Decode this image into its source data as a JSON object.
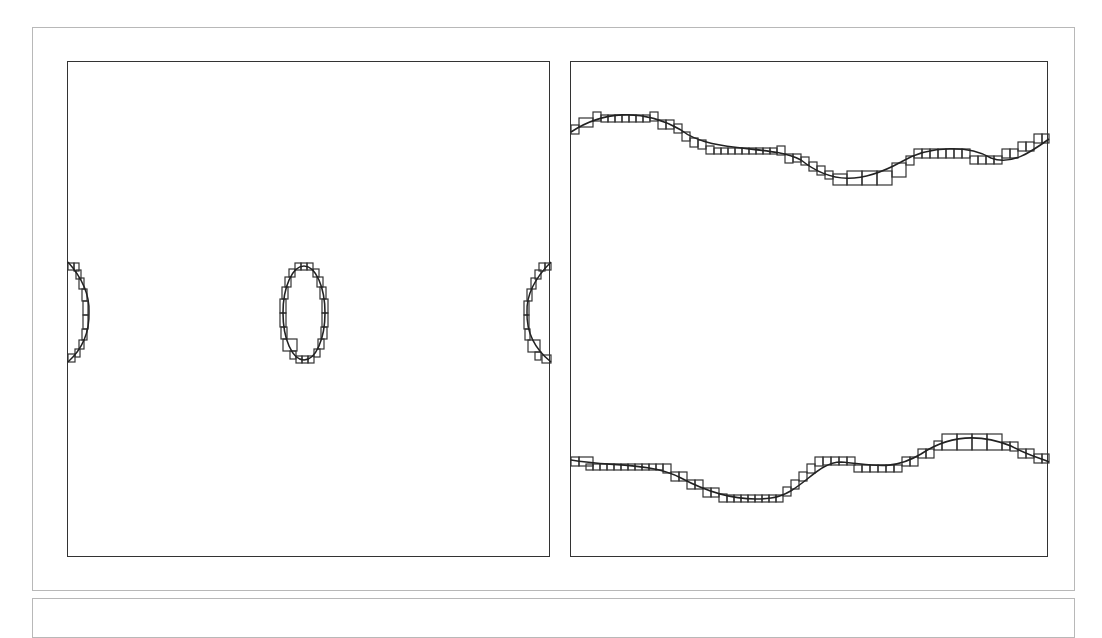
{
  "figure": {
    "panels": [
      {
        "id": "left",
        "content": "closed elliptical contour in center and two half-contours at left/right boundaries (periodic), each traced by small square cells"
      },
      {
        "id": "right",
        "content": "two wavy horizontal interface curves (upper and lower), each traced by a staircase of small square cells"
      }
    ],
    "colors": {
      "stroke": "#333333",
      "frame": "#b8b8b8",
      "background": "#ffffff"
    }
  }
}
